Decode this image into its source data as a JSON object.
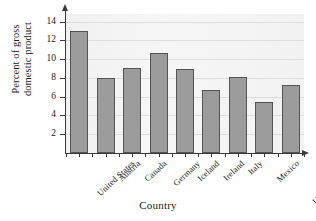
{
  "chart_data": {
    "type": "bar",
    "title": "",
    "xlabel": "Country",
    "ylabel": "Percent of gross domestic product",
    "ylabel_lines": [
      "Percent of gross",
      "domestic product"
    ],
    "categories": [
      "United States",
      "Austria",
      "Canada",
      "Germany",
      "Iceland",
      "Ireland",
      "Italy",
      "Mexico",
      "United Kingdom"
    ],
    "values": [
      13.0,
      8.0,
      9.1,
      10.6,
      8.9,
      6.7,
      8.05,
      5.45,
      7.25
    ],
    "ylim": [
      0,
      14.8
    ],
    "yticks": [
      2,
      4,
      6,
      8,
      10,
      12,
      14
    ],
    "ytick_labels": [
      "2",
      "4",
      "6",
      "8",
      "10",
      "12",
      "14"
    ],
    "grid": true,
    "grid_axis": "y",
    "legend": false,
    "legend_position": "none",
    "bar_color": "#9b9b9b",
    "bar_edge_color": "#545454",
    "plot_background": "#f4f4f4",
    "axis_color": "#3a3a3a",
    "gridline_color": "#dddddd"
  }
}
